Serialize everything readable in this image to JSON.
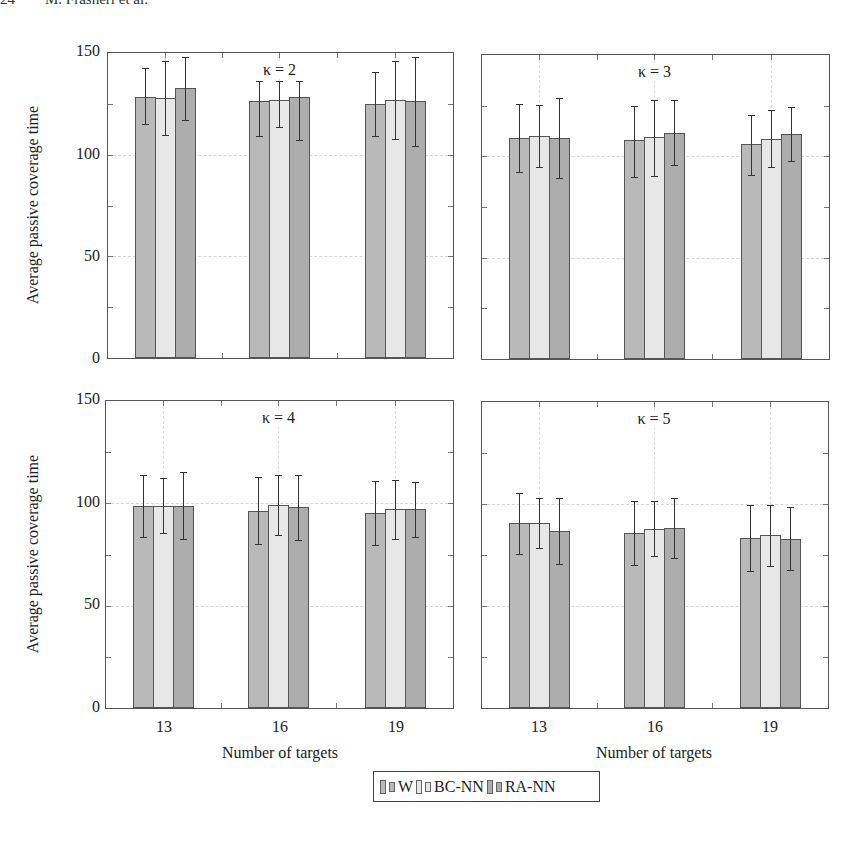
{
  "page": {
    "running_header": "24        M. Frasheri et al."
  },
  "legend": {
    "items": [
      {
        "label": "W",
        "color": "#b9b9b9"
      },
      {
        "label": "BC-NN",
        "color": "#e7e7e7"
      },
      {
        "label": "RA-NN",
        "color": "#adadad"
      }
    ]
  },
  "axes": {
    "ylabel": "Average passive coverage time",
    "xlabel": "Number of targets",
    "yticks": [
      "0",
      "50",
      "100",
      "150"
    ],
    "xticks": [
      "13",
      "16",
      "19"
    ]
  },
  "chart_data": [
    {
      "type": "bar",
      "title": "κ = 2",
      "categories": [
        "13",
        "16",
        "19"
      ],
      "xlabel": "Number of targets",
      "ylabel": "Average passive coverage time",
      "ylim": [
        0,
        150
      ],
      "grid": true,
      "legend_position": "bottom-center",
      "series": [
        {
          "name": "W",
          "values": [
            128.6,
            126.6,
            124.9
          ],
          "err_low": [
            115,
            109,
            109
          ],
          "err_high": [
            142.5,
            136,
            140.7
          ]
        },
        {
          "name": "BC-NN",
          "values": [
            127.8,
            126.8,
            127.0
          ],
          "err_low": [
            109.6,
            113.4,
            107.5
          ],
          "err_high": [
            146,
            136,
            146
          ]
        },
        {
          "name": "RA-NN",
          "values": [
            132.7,
            128.4,
            126.3
          ],
          "err_low": [
            117,
            107.2,
            104.3
          ],
          "err_high": [
            148,
            136,
            148.2
          ]
        }
      ]
    },
    {
      "type": "bar",
      "title": "κ = 3",
      "categories": [
        "13",
        "16",
        "19"
      ],
      "xlabel": "Number of targets",
      "ylabel": "",
      "ylim": [
        0,
        150
      ],
      "grid": true,
      "series": [
        {
          "name": "W",
          "values": [
            109.3,
            108.0,
            106.0
          ],
          "err_low": [
            92.5,
            90.0,
            90.8
          ],
          "err_high": [
            126.0,
            124.7,
            120.4
          ]
        },
        {
          "name": "BC-NN",
          "values": [
            110.0,
            109.6,
            108.8
          ],
          "err_low": [
            94.6,
            90.3,
            94.6
          ],
          "err_high": [
            125.5,
            127.8,
            123.0
          ]
        },
        {
          "name": "RA-NN",
          "values": [
            109.3,
            111.7,
            111.0
          ],
          "err_low": [
            89.5,
            95.7,
            97.7
          ],
          "err_high": [
            129.0,
            127.6,
            124.5
          ]
        }
      ]
    },
    {
      "type": "bar",
      "title": "κ = 4",
      "categories": [
        "13",
        "16",
        "19"
      ],
      "xlabel": "Number of targets",
      "ylabel": "Average passive coverage time",
      "ylim": [
        0,
        150
      ],
      "grid": true,
      "series": [
        {
          "name": "W",
          "values": [
            98.8,
            96.4,
            95.4
          ],
          "err_low": [
            83.7,
            80.0,
            79.6
          ],
          "err_high": [
            113.8,
            113.0,
            111.0
          ]
        },
        {
          "name": "BC-NN",
          "values": [
            98.5,
            99.2,
            97.1
          ],
          "err_low": [
            85.3,
            84.4,
            82.6
          ],
          "err_high": [
            112.2,
            113.7,
            111.5
          ]
        },
        {
          "name": "RA-NN",
          "values": [
            98.8,
            98.0,
            97.1
          ],
          "err_low": [
            82.6,
            82.0,
            83.7
          ],
          "err_high": [
            115.1,
            113.7,
            110.2
          ]
        }
      ]
    },
    {
      "type": "bar",
      "title": "κ = 5",
      "categories": [
        "13",
        "16",
        "19"
      ],
      "xlabel": "Number of targets",
      "ylabel": "",
      "ylim": [
        0,
        150
      ],
      "grid": true,
      "series": [
        {
          "name": "W",
          "values": [
            90.5,
            85.8,
            83.5
          ],
          "err_low": [
            75.7,
            70.0,
            67.0
          ],
          "err_high": [
            105.5,
            101.6,
            99.7
          ]
        },
        {
          "name": "BC-NN",
          "values": [
            90.7,
            87.9,
            84.7
          ],
          "err_low": [
            78.2,
            74.3,
            69.4
          ],
          "err_high": [
            103.0,
            101.3,
            99.5
          ]
        },
        {
          "name": "RA-NN",
          "values": [
            87.0,
            88.3,
            83.0
          ],
          "err_low": [
            70.8,
            73.3,
            67.8
          ],
          "err_high": [
            103.0,
            103.0,
            98.3
          ]
        }
      ]
    }
  ]
}
